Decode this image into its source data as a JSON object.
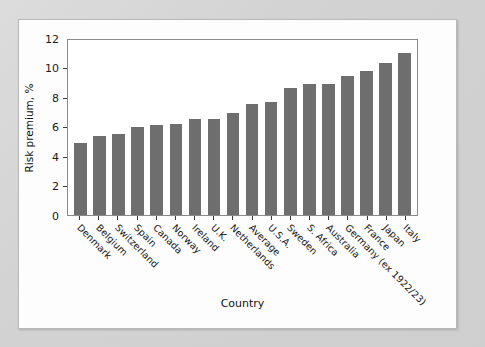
{
  "chart_data": {
    "type": "bar",
    "title": "",
    "xlabel": "Country",
    "ylabel": "Risk premium, %",
    "ylim": [
      0,
      12
    ],
    "yticks": [
      0,
      2,
      4,
      6,
      8,
      10,
      12
    ],
    "grid": false,
    "legend": false,
    "bar_color": "#6e6e6e",
    "categories": [
      "Denmark",
      "Belgium",
      "Switzerland",
      "Spain",
      "Canada",
      "Norway",
      "Ireland",
      "U.K.",
      "Netherlands",
      "Average",
      "U.S.A.",
      "Sweden",
      "S. Africa",
      "Australia",
      "Germany (ex 1922/23)",
      "France",
      "Japan",
      "Italy"
    ],
    "values": [
      4.9,
      5.35,
      5.5,
      6.0,
      6.1,
      6.2,
      6.5,
      6.5,
      6.9,
      7.55,
      7.65,
      8.6,
      8.85,
      8.9,
      9.4,
      9.75,
      10.3,
      11.0
    ]
  },
  "axes": {
    "y_title": "Risk premium, %",
    "x_title": "Country",
    "y_tick_labels": [
      "12",
      "10",
      "8",
      "6",
      "4",
      "2",
      "0"
    ]
  },
  "colors": {
    "bar": "#6e6e6e",
    "frame": "#8a8a8a",
    "panel": "#fdfdfd",
    "backdrop": "#d5d5d5",
    "text": "#141414"
  }
}
